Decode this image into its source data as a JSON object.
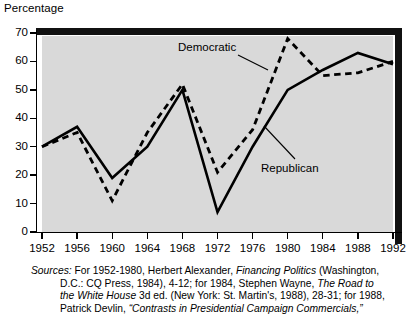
{
  "axis_caption": "Percentage",
  "chart_data": {
    "type": "line",
    "title": "",
    "subtitle": "",
    "xlabel": "",
    "ylabel": "Percentage",
    "ylim": [
      0,
      70
    ],
    "xlim": [
      1952,
      1992
    ],
    "grid": false,
    "legend_position": "inline-annotations",
    "x": [
      1952,
      1956,
      1960,
      1964,
      1968,
      1972,
      1976,
      1980,
      1984,
      1988,
      1992
    ],
    "categories": [
      "1952",
      "1956",
      "1960",
      "1964",
      "1968",
      "1972",
      "1976",
      "1980",
      "1984",
      "1988",
      "1992"
    ],
    "y_ticks": [
      0,
      10,
      20,
      30,
      40,
      50,
      60,
      70
    ],
    "series": [
      {
        "name": "Democratic",
        "style": "dashed",
        "values": [
          30,
          35,
          11,
          35,
          52,
          21,
          36,
          68,
          55,
          56,
          60
        ]
      },
      {
        "name": "Republican",
        "style": "solid",
        "values": [
          30,
          37,
          19,
          30,
          50,
          7,
          30,
          50,
          57,
          63,
          59
        ]
      }
    ],
    "annotations": [
      {
        "text": "Democratic",
        "series": "Democratic"
      },
      {
        "text": "Republican",
        "series": "Republican"
      }
    ]
  },
  "source_note": {
    "label": "Sources:",
    "line1_rest_a": " For 1952-1980, Herbert Alexander, ",
    "line1_italic": "Financing Politics",
    "line1_rest_b": " (Washington,",
    "line2_a": "D.C.: CQ Press, 1984), 4-12; for 1984, Stephen Wayne, ",
    "line2_italic": "The Road to",
    "line3_italic": "the White House",
    "line3_rest": " 3d ed. (New York: St. Martin's, 1988), 28-31; for 1988,",
    "line4_a": "Patrick Devlin, ",
    "line4_italic": "“Contrasts  in Presidential Campaign Commercials,”"
  }
}
